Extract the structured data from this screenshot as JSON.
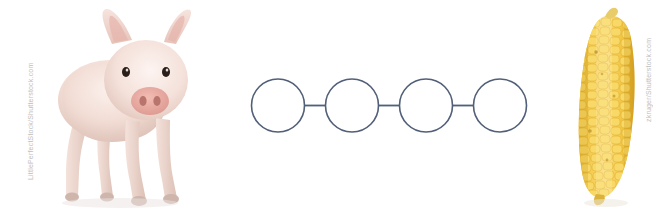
{
  "page": {
    "width": 668,
    "height": 214,
    "background_color": "#ffffff"
  },
  "left_image": {
    "name": "piglet-photo",
    "subject": "piglet",
    "alt_text": "Young pink piglet standing, facing forward, on white background",
    "watermark": "LittlePerfectStock/Shutterstock.com",
    "colors": {
      "body": "#f3ded7",
      "body_shadow": "#e0c5bc",
      "snout": "#e8a8a0",
      "ear_inner": "#e9b7ae",
      "eye": "#2b1d18",
      "hoof": "#d8c3bb"
    }
  },
  "center_diagram": {
    "name": "chain-diagram",
    "type": "linked-circles",
    "circle_count": 4,
    "connector_count": 3,
    "circle_labels": [
      "",
      "",
      "",
      ""
    ],
    "stroke_color": "#525f78",
    "fill_color": "#ffffff",
    "stroke_width": 1.6,
    "circle_radius": 26.5,
    "circles": [
      {
        "cx": 33,
        "cy": 35.5
      },
      {
        "cx": 107,
        "cy": 35.5
      },
      {
        "cx": 181,
        "cy": 35.5
      },
      {
        "cx": 255,
        "cy": 35.5
      }
    ],
    "connectors": [
      {
        "x1": 59.5,
        "y1": 35.5,
        "x2": 80.5,
        "y2": 35.5
      },
      {
        "x1": 133.5,
        "y1": 35.5,
        "x2": 154.5,
        "y2": 35.5
      },
      {
        "x1": 207.5,
        "y1": 35.5,
        "x2": 228.5,
        "y2": 35.5
      }
    ]
  },
  "right_image": {
    "name": "corn-photo",
    "subject": "corn cob",
    "alt_text": "Ear of yellow sweet corn standing upright on white background",
    "watermark": "zkruger/Shutterstock.com",
    "colors": {
      "kernel_light": "#f7d464",
      "kernel_mid": "#f0c13c",
      "kernel_dark": "#dba82a",
      "tip": "#e7c559",
      "shadow": "#c99820"
    }
  }
}
